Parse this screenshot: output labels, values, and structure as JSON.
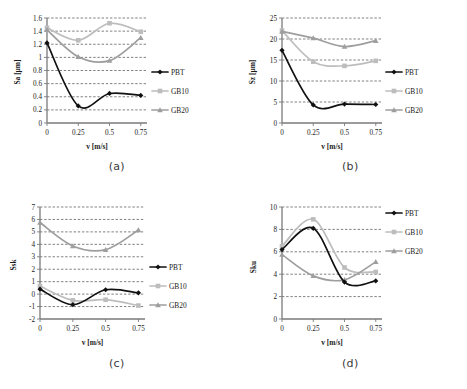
{
  "figure": {
    "panels": [
      "a",
      "b",
      "c",
      "d"
    ],
    "captions": {
      "a": "(a)",
      "b": "(b)",
      "c": "(c)",
      "d": "(d)"
    },
    "xlabel": "v [m/s]",
    "series_names": [
      "PBT",
      "GB10",
      "GB20"
    ],
    "colors": {
      "PBT": "#111111",
      "GB10": "#bdbdbd",
      "GB20": "#9e9e9e"
    },
    "markers": {
      "PBT": "diamond",
      "GB10": "square",
      "GB20": "triangle"
    }
  },
  "chart_data": [
    {
      "panel": "a",
      "type": "line",
      "title": "",
      "xlabel": "v [m/s]",
      "ylabel": "Sa [µm]",
      "x": [
        0,
        0.25,
        0.5,
        0.75
      ],
      "xticklabels": [
        "0",
        "0.25",
        "0.5",
        "0.75"
      ],
      "xlim": [
        0,
        0.8
      ],
      "ylim": [
        0,
        1.6
      ],
      "yticks": [
        0,
        0.2,
        0.4,
        0.6,
        0.8,
        1,
        1.2,
        1.4,
        1.6
      ],
      "yticklabels": [
        "0",
        "0.2",
        "0.4",
        "0.6",
        "0.8",
        "1",
        "1.2",
        "1.4",
        "1.6"
      ],
      "grid": "horizontal-dashed",
      "legend": [
        "PBT",
        "GB10",
        "GB20"
      ],
      "legend_position": "right",
      "series": [
        {
          "name": "PBT",
          "values": [
            1.22,
            0.26,
            0.45,
            0.42
          ]
        },
        {
          "name": "GB10",
          "values": [
            1.45,
            1.26,
            1.52,
            1.39
          ]
        },
        {
          "name": "GB20",
          "values": [
            1.42,
            1.01,
            0.95,
            1.3
          ]
        }
      ]
    },
    {
      "panel": "b",
      "type": "line",
      "title": "",
      "xlabel": "v [m/s]",
      "ylabel": "Sz [µm]",
      "x": [
        0,
        0.25,
        0.5,
        0.75
      ],
      "xticklabels": [
        "0",
        "0.25",
        "0.5",
        "0.75"
      ],
      "xlim": [
        0,
        0.8
      ],
      "ylim": [
        0,
        25
      ],
      "yticks": [
        0,
        5,
        10,
        15,
        20,
        25
      ],
      "yticklabels": [
        "0",
        "5",
        "10",
        "15",
        "20",
        "25"
      ],
      "grid": "horizontal-dashed",
      "legend": [
        "PBT",
        "GB10",
        "GB20"
      ],
      "legend_position": "right",
      "series": [
        {
          "name": "PBT",
          "values": [
            17.3,
            4.3,
            4.5,
            4.4
          ]
        },
        {
          "name": "GB10",
          "values": [
            22.0,
            14.6,
            13.6,
            14.8
          ]
        },
        {
          "name": "GB20",
          "values": [
            21.8,
            20.2,
            18.2,
            19.6
          ]
        }
      ]
    },
    {
      "panel": "c",
      "type": "line",
      "title": "",
      "xlabel": "v [m/s]",
      "ylabel": "Ssk",
      "x": [
        0,
        0.25,
        0.5,
        0.75
      ],
      "xticklabels": [
        "0",
        "0.25",
        "0.5",
        "0.75"
      ],
      "xlim": [
        0,
        0.8
      ],
      "ylim": [
        -2,
        7
      ],
      "yticks": [
        -2,
        -1,
        0,
        1,
        2,
        3,
        4,
        5,
        6,
        7
      ],
      "yticklabels": [
        "-2",
        "-1",
        "0",
        "1",
        "2",
        "3",
        "4",
        "5",
        "6",
        "7"
      ],
      "grid": "horizontal-dashed",
      "legend": [
        "PBT",
        "GB10",
        "GB20"
      ],
      "legend_position": "right",
      "series": [
        {
          "name": "PBT",
          "values": [
            0.4,
            -0.85,
            0.35,
            0.1
          ]
        },
        {
          "name": "GB10",
          "values": [
            0.65,
            -0.5,
            -0.45,
            -0.92
          ]
        },
        {
          "name": "GB20",
          "values": [
            5.75,
            3.87,
            3.57,
            5.15
          ]
        }
      ]
    },
    {
      "panel": "d",
      "type": "line",
      "title": "",
      "xlabel": "v [m/s]",
      "ylabel": "Sku",
      "x": [
        0,
        0.25,
        0.5,
        0.75
      ],
      "xticklabels": [
        "0",
        "0.25",
        "0.5",
        "0.75"
      ],
      "xlim": [
        0,
        0.8
      ],
      "ylim": [
        0,
        10
      ],
      "yticks": [
        0,
        2,
        4,
        6,
        8,
        10
      ],
      "yticklabels": [
        "0",
        "2",
        "4",
        "6",
        "8",
        "10"
      ],
      "grid": "horizontal-dashed",
      "legend": [
        "PBT",
        "GB10",
        "GB20"
      ],
      "legend_position": "right",
      "series": [
        {
          "name": "PBT",
          "values": [
            6.2,
            8.1,
            3.3,
            3.4
          ]
        },
        {
          "name": "GB10",
          "values": [
            6.5,
            8.9,
            4.6,
            4.2
          ]
        },
        {
          "name": "GB20",
          "values": [
            5.75,
            3.85,
            3.5,
            5.1
          ]
        }
      ]
    }
  ]
}
